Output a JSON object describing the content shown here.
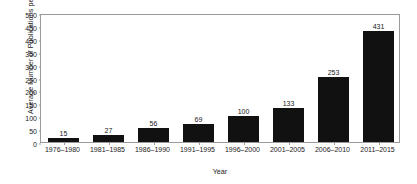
{
  "chart_data": {
    "type": "bar",
    "title": "",
    "xlabel": "Year",
    "ylabel": "Average Number of Publications per Year",
    "categories": [
      "1976–1980",
      "1981–1985",
      "1986–1990",
      "1991–1995",
      "1996–2000",
      "2001–2005",
      "2006–2010",
      "2011–2015"
    ],
    "values": [
      15,
      27,
      56,
      69,
      100,
      133,
      253,
      431
    ],
    "value_labels": [
      "15",
      "27",
      "56",
      "69",
      "100",
      "133",
      "253",
      "431"
    ],
    "ylim": [
      0,
      500
    ],
    "yticks": [
      0,
      50,
      100,
      150,
      200,
      250,
      300,
      350,
      400,
      450,
      500
    ],
    "ytick_labels": [
      "0",
      "50",
      "100",
      "150",
      "200",
      "250",
      "300",
      "350",
      "400",
      "450",
      "500"
    ],
    "grid": false,
    "legend": null,
    "bar_color": "#111111",
    "frame_color": "#9a9a9a",
    "text_color": "#1a1a1a",
    "background": "#ffffff"
  }
}
